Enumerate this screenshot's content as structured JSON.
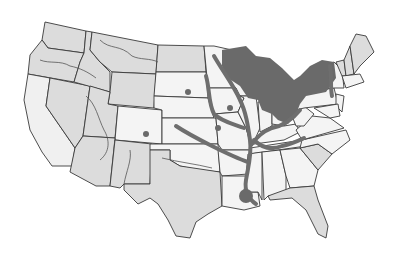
{
  "map": {
    "title": "",
    "region": "Contiguous United States",
    "style": "grayscale",
    "colors": {
      "background": "#ffffff",
      "state_fill_light": "#dcdcdc",
      "state_fill_white": "#f4f4f4",
      "highlight": "#6a6a6a",
      "border": "#3a3a3a"
    },
    "highlighted_areas": [
      "Great Lakes region",
      "Upper Midwest",
      "Ohio River valley",
      "Mississippi River corridor",
      "Missouri River corridor",
      "Arkansas River corridor",
      "Lower Mississippi / Louisiana delta",
      "Northeast river valleys"
    ]
  }
}
